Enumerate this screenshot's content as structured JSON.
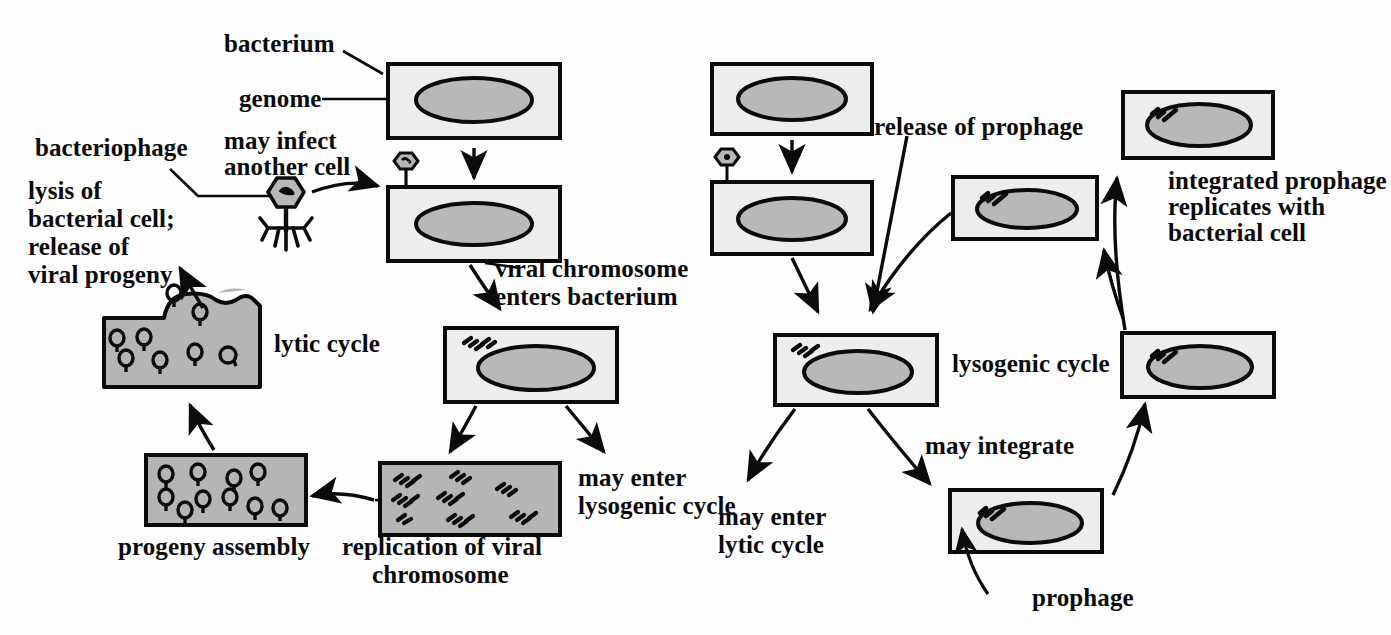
{
  "figure": {
    "colors": {
      "ink": "#0b0b0b",
      "cell_fill": "#ededed",
      "genome_fill": "#b8b8b8",
      "lysed_fill": "#b5b5b5",
      "background": "#fdfdfd"
    }
  },
  "labels": {
    "bacterium": "bacterium",
    "genome": "genome",
    "bacteriophage": "bacteriophage",
    "may_infect_another_cell_l1": "may infect",
    "may_infect_another_cell_l2": "another cell",
    "lysis_l1": "lysis of",
    "lysis_l2": "bacterial cell;",
    "lysis_l3": "release of",
    "lysis_l4": "viral progeny",
    "lytic_cycle": "lytic cycle",
    "viral_chromosome_enters_l1": "viral chromosome",
    "viral_chromosome_enters_l2": "enters bacterium",
    "may_enter_lysogenic_l1": "may enter",
    "may_enter_lysogenic_l2": "lysogenic cycle",
    "progeny_assembly": "progeny assembly",
    "replication_l1": "replication of viral",
    "replication_l2": "chromosome",
    "release_of_prophage": "release of prophage",
    "integrated_prophage_l1": "integrated prophage",
    "integrated_prophage_l2": "replicates with",
    "integrated_prophage_l3": "bacterial cell",
    "lysogenic_cycle": "lysogenic cycle",
    "may_integrate": "may integrate",
    "may_enter_lytic_l1": "may enter",
    "may_enter_lytic_l2": "lytic cycle",
    "prophage": "prophage"
  },
  "diagram_data": {
    "type": "diagram",
    "cycles": [
      {
        "name": "lytic cycle",
        "side": "left",
        "steps": [
          "bacterium with genome",
          "bacteriophage attaches to bacterium",
          "viral chromosome enters bacterium",
          "replication of viral chromosome",
          "progeny assembly",
          "lysis of bacterial cell; release of viral progeny",
          "may infect another cell"
        ]
      },
      {
        "name": "lysogenic cycle",
        "side": "right",
        "steps": [
          "bacterium with genome",
          "bacteriophage attaches to bacterium",
          "viral chromosome enters bacterium",
          "may integrate as prophage",
          "integrated prophage replicates with bacterial cell",
          "release of prophage",
          "may enter lytic cycle"
        ]
      }
    ],
    "cell_boxes": [
      {
        "id": "left-top-bacterium",
        "x": 388,
        "y": 64,
        "w": 172,
        "h": 74,
        "has_phage": false,
        "has_prophage": false,
        "free_chromosome": false
      },
      {
        "id": "left-infected-bacterium",
        "x": 388,
        "y": 187,
        "w": 172,
        "h": 74,
        "has_phage": true,
        "has_prophage": false,
        "free_chromosome": false
      },
      {
        "id": "left-chromosome-inside",
        "x": 445,
        "y": 328,
        "w": 172,
        "h": 74,
        "has_phage": false,
        "has_prophage": false,
        "free_chromosome": true
      },
      {
        "id": "left-replication",
        "x": 380,
        "y": 463,
        "w": 180,
        "h": 72,
        "content": "many viral chromosomes"
      },
      {
        "id": "left-progeny-assembly",
        "x": 146,
        "y": 455,
        "w": 160,
        "h": 70,
        "content": "assembled phage particles"
      },
      {
        "id": "left-lysed-cell",
        "x": 104,
        "y": 297,
        "w": 156,
        "h": 90,
        "content": "lysed cell releasing phage"
      },
      {
        "id": "right-top-bacterium",
        "x": 712,
        "y": 64,
        "w": 160,
        "h": 70,
        "has_phage": false
      },
      {
        "id": "right-infected-bacterium",
        "x": 712,
        "y": 182,
        "w": 160,
        "h": 72,
        "has_phage": true
      },
      {
        "id": "right-chromosome-inside",
        "x": 775,
        "y": 335,
        "w": 162,
        "h": 70,
        "free_chromosome": true
      },
      {
        "id": "right-prophage-integrating",
        "x": 950,
        "y": 490,
        "w": 152,
        "h": 62,
        "has_prophage": true
      },
      {
        "id": "right-prophage-mid",
        "x": 1122,
        "y": 333,
        "w": 152,
        "h": 64,
        "has_prophage": true
      },
      {
        "id": "right-prophage-top",
        "x": 1123,
        "y": 92,
        "w": 150,
        "h": 66,
        "has_prophage": true
      },
      {
        "id": "right-prophage-left",
        "x": 953,
        "y": 177,
        "w": 144,
        "h": 62,
        "has_prophage": true
      }
    ]
  }
}
